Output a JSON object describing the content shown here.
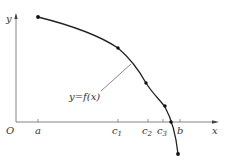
{
  "diagram": {
    "axes": {
      "x_label": "x",
      "y_label": "y",
      "origin_label": "O"
    },
    "x_ticks": [
      {
        "label": "a",
        "base": "a",
        "sub": ""
      },
      {
        "label": "c1",
        "base": "c",
        "sub": "1"
      },
      {
        "label": "c2",
        "base": "c",
        "sub": "2"
      },
      {
        "label": "c3",
        "base": "c",
        "sub": "3"
      },
      {
        "label": "b",
        "base": "b",
        "sub": ""
      }
    ],
    "curve_label": "y=f(x)",
    "curve_points": [
      {
        "name": "start-point-a"
      },
      {
        "name": "point-c1"
      },
      {
        "name": "point-c2"
      },
      {
        "name": "point-c3"
      },
      {
        "name": "end-point-b"
      }
    ],
    "colors": {
      "curve": "#222222",
      "axes": "#555555",
      "text": "#333333"
    }
  }
}
